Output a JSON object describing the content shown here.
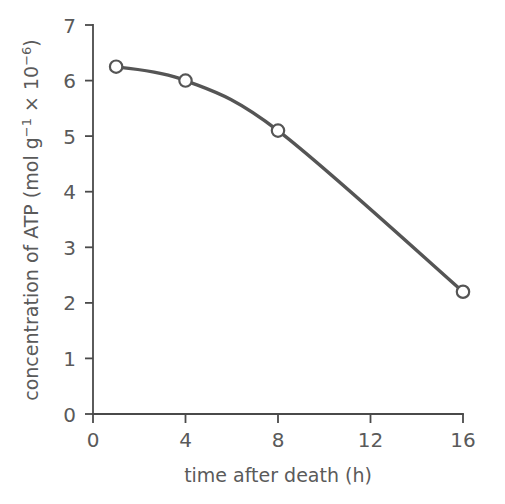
{
  "figure": {
    "background_color": "#ffffff",
    "line_color": "#555555",
    "axis_color": "#4a4a4a",
    "text_color": "#5a5a5a",
    "marker_fill": "#ffffff"
  },
  "axis": {
    "x_title": "time after death (h)",
    "y_title_main": "concentration of ATP (mol g",
    "y_title_sup1": "−1",
    "y_title_mid": " × 10",
    "y_title_sup2": "−6",
    "y_title_end": ")",
    "y_title_full": "concentration of ATP (mol g−1 × 10−6)",
    "x_ticks": [
      "0",
      "4",
      "8",
      "12",
      "16"
    ],
    "y_ticks": [
      "0",
      "1",
      "2",
      "3",
      "4",
      "5",
      "6",
      "7"
    ]
  },
  "chart_data": {
    "type": "line",
    "title": "",
    "subtitle": "",
    "xlabel": "time after death (h)",
    "ylabel": "concentration of ATP (mol g−1 × 10−6)",
    "xlim": [
      0,
      16
    ],
    "ylim": [
      0,
      7
    ],
    "xticks": [
      0,
      4,
      8,
      12,
      16
    ],
    "yticks": [
      0,
      1,
      2,
      3,
      4,
      5,
      6,
      7
    ],
    "grid": false,
    "legend": false,
    "marker": "open-circle",
    "line_style": "smooth",
    "series": [
      {
        "name": "ATP concentration",
        "x": [
          1,
          4,
          8,
          16
        ],
        "values": [
          6.25,
          6.0,
          5.1,
          2.2
        ],
        "points": [
          {
            "x": 1,
            "y": 6.25
          },
          {
            "x": 4,
            "y": 6.0
          },
          {
            "x": 8,
            "y": 5.1
          },
          {
            "x": 16,
            "y": 2.2
          }
        ]
      }
    ]
  }
}
